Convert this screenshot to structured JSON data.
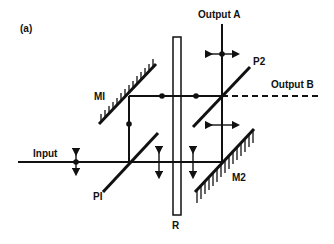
{
  "figure": {
    "panel_label": "(a)"
  },
  "labels": {
    "output_a": "Output A",
    "output_b": "Output B",
    "input": "Input",
    "mirror_1": "MI",
    "mirror_2": "M2",
    "polarizer_1": "PI",
    "polarizer_2": "P2",
    "rotator": "R"
  },
  "components": [
    {
      "id": "M1",
      "type": "mirror",
      "label": "MI"
    },
    {
      "id": "M2",
      "type": "mirror",
      "label": "M2"
    },
    {
      "id": "P1",
      "type": "polarizing-beamsplitter",
      "label": "PI"
    },
    {
      "id": "P2",
      "type": "polarizing-beamsplitter",
      "label": "P2"
    },
    {
      "id": "R",
      "type": "rotator-plate",
      "label": "R"
    }
  ],
  "beams": [
    {
      "name": "input",
      "polarization": "vertical+dot"
    },
    {
      "name": "upper-path",
      "polarization": "dot"
    },
    {
      "name": "left-vertical",
      "polarization": "dot"
    },
    {
      "name": "lower-path",
      "polarization": "vertical"
    },
    {
      "name": "right-vertical",
      "polarization": "horizontal"
    },
    {
      "name": "output-a",
      "polarization": "horizontal+dot"
    },
    {
      "name": "output-b",
      "style": "dashed"
    }
  ],
  "colors": {
    "ink": "#111111",
    "background": "#ffffff"
  }
}
